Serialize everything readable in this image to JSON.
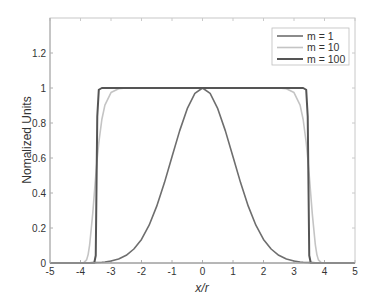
{
  "chart_data": {
    "type": "line",
    "title": "",
    "xlabel": "x/r",
    "ylabel": "Nomalized Units",
    "xlim": [
      -5,
      5
    ],
    "ylim": [
      0,
      1.4
    ],
    "xticks": [
      -5,
      -4,
      -3,
      -2,
      -1,
      0,
      1,
      2,
      3,
      4,
      5
    ],
    "xtick_labels": [
      "-5",
      "-4",
      "-3",
      "-2",
      "-1",
      "0",
      "1",
      "2",
      "3",
      "4",
      "5"
    ],
    "yticks": [
      0,
      0.2,
      0.4,
      0.6,
      0.8,
      1,
      1.2
    ],
    "ytick_labels": [
      "0",
      "0.2",
      "0.4",
      "0.6",
      "0.8",
      "1",
      "1.2"
    ],
    "grid": false,
    "legend_position": "upper right",
    "x": [
      -5,
      -4.5,
      -4,
      -3.9,
      -3.8,
      -3.75,
      -3.7,
      -3.6,
      -3.55,
      -3.5,
      -3.45,
      -3.4,
      -3.3,
      -3.2,
      -3,
      -2.75,
      -2.5,
      -2.25,
      -2,
      -1.75,
      -1.5,
      -1.25,
      -1,
      -0.75,
      -0.5,
      -0.25,
      0,
      0.25,
      0.5,
      0.75,
      1,
      1.25,
      1.5,
      1.75,
      2,
      2.25,
      2.5,
      2.75,
      3,
      3.2,
      3.3,
      3.4,
      3.45,
      3.5,
      3.55,
      3.6,
      3.7,
      3.75,
      3.8,
      3.9,
      4,
      4.5,
      5
    ],
    "series": [
      {
        "name": "m = 1",
        "color": "#6e6e6e",
        "width": 1.6,
        "values": [
          0,
          0,
          0,
          0,
          0.001,
          0.001,
          0.001,
          0.002,
          0.002,
          0.002,
          0.003,
          0.003,
          0.004,
          0.006,
          0.011,
          0.023,
          0.044,
          0.08,
          0.135,
          0.216,
          0.325,
          0.458,
          0.607,
          0.755,
          0.882,
          0.969,
          1,
          0.969,
          0.882,
          0.755,
          0.607,
          0.458,
          0.325,
          0.216,
          0.135,
          0.08,
          0.044,
          0.023,
          0.011,
          0.006,
          0.004,
          0.003,
          0.003,
          0.002,
          0.002,
          0.002,
          0.001,
          0.001,
          0.001,
          0,
          0,
          0,
          0
        ]
      },
      {
        "name": "m = 10",
        "color": "#c4c4c4",
        "width": 1.6,
        "values": [
          0,
          0,
          0,
          0.001,
          0.018,
          0.048,
          0.103,
          0.281,
          0.39,
          0.499,
          0.6,
          0.687,
          0.82,
          0.902,
          0.974,
          0.996,
          1,
          1,
          1,
          1,
          1,
          1,
          1,
          1,
          1,
          1,
          1,
          1,
          1,
          1,
          1,
          1,
          1,
          1,
          1,
          1,
          1,
          0.996,
          0.974,
          0.902,
          0.82,
          0.687,
          0.6,
          0.499,
          0.39,
          0.281,
          0.103,
          0.048,
          0.018,
          0.001,
          0,
          0,
          0
        ]
      },
      {
        "name": "m = 100",
        "color": "#555555",
        "width": 2,
        "values": [
          0,
          0,
          0,
          0,
          0,
          0,
          0,
          0,
          0,
          0.043,
          0.837,
          0.99,
          1,
          1,
          1,
          1,
          1,
          1,
          1,
          1,
          1,
          1,
          1,
          1,
          1,
          1,
          1,
          1,
          1,
          1,
          1,
          1,
          1,
          1,
          1,
          1,
          1,
          1,
          1,
          1,
          1,
          0.99,
          0.837,
          0.043,
          0,
          0,
          0,
          0,
          0,
          0,
          0,
          0,
          0
        ]
      }
    ]
  },
  "legend": {
    "items": [
      {
        "label": "m = 1"
      },
      {
        "label": "m = 10"
      },
      {
        "label": "m = 100"
      }
    ]
  },
  "axes": {
    "xlabel": "x/r",
    "ylabel": "Nomalized Units"
  }
}
